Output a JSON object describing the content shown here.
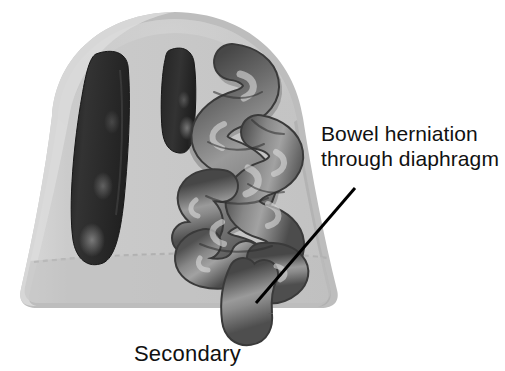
{
  "figure": {
    "type": "medical-illustration",
    "background_color": "#ffffff"
  },
  "annotation": {
    "name": "bowel-herniation-callout",
    "line1": "Bowel herniation",
    "line2": "through diaphragm",
    "text_color": "#111111",
    "leader_line": {
      "color": "#000000",
      "width_px": 3,
      "x1": 355,
      "y1": 188,
      "x2": 256,
      "y2": 303
    }
  },
  "caption": {
    "name": "figure-caption",
    "text": "Secondary",
    "text_color": "#111111"
  },
  "anatomy": {
    "thorax": {
      "label": "thoracic cavity outline",
      "fill_color": "#c9c9c9",
      "rim_color": "#b0b0b0",
      "outline_color": "#9a9a9a"
    },
    "diaphragm": {
      "label": "diaphragm line",
      "color": "#b3b3b3"
    },
    "lung_lobes": [
      {
        "label": "hypoplastic lung - large lobe",
        "fill_color": "#2a2a2a"
      },
      {
        "label": "hypoplastic lung - small lobe",
        "fill_color": "#2a2a2a"
      }
    ],
    "bowel": {
      "label": "herniated bowel loops",
      "fill_color": "#757575",
      "shadow_color": "#4a4a4a",
      "highlight_color": "#cfcfcf",
      "outline_color": "#3a3a3a"
    }
  }
}
